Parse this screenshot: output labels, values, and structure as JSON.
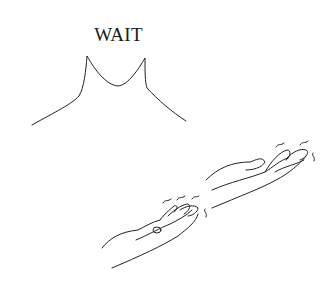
{
  "sign": {
    "word": "WAIT",
    "figure": "shoulders-outline",
    "hands": [
      "left-hand-palm-up-fingers-wiggling",
      "right-hand-palm-up-fingers-wiggling"
    ],
    "motion_marks": "wiggle-lines"
  },
  "colors": {
    "ink": "#222222",
    "background": "#ffffff"
  }
}
